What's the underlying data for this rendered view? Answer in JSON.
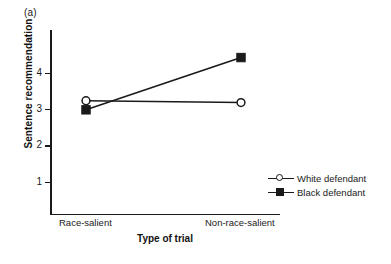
{
  "figure": {
    "panel_label": "(a)"
  },
  "chart_data": {
    "type": "line",
    "title": "",
    "subtitle": "",
    "xlabel": "Type of trial",
    "ylabel": "Sentence recommendation",
    "categories": [
      "Race-salient",
      "Non-race-salient"
    ],
    "series": [
      {
        "name": "White defendant",
        "marker": "open-circle",
        "values": [
          3.23,
          3.18
        ]
      },
      {
        "name": "Black defendant",
        "marker": "filled-square",
        "values": [
          2.98,
          4.42
        ]
      }
    ],
    "ylim": [
      0,
      4.9
    ],
    "yticks": [
      1,
      2,
      3,
      4
    ],
    "ytick_labels": [
      "1",
      "2",
      "3",
      "4"
    ],
    "xtick_labels": [
      "Race-salient",
      "Non-race-salient"
    ],
    "grid": false,
    "legend_position": "right",
    "line_color": "#1a1a1a"
  },
  "legend": {
    "items": [
      {
        "label": "White defendant"
      },
      {
        "label": "Black defendant"
      }
    ]
  },
  "axis": {
    "ytick_labels": [
      "4",
      "3",
      "2",
      "1"
    ]
  }
}
